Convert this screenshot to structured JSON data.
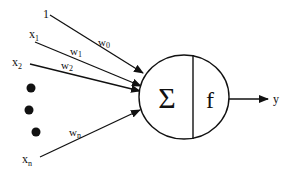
{
  "diagram": {
    "inputs": [
      {
        "label": "1",
        "sub": "",
        "weight": "w",
        "weight_sub": "0"
      },
      {
        "label": "x",
        "sub": "1",
        "weight": "w",
        "weight_sub": "1"
      },
      {
        "label": "x",
        "sub": "2",
        "weight": "w",
        "weight_sub": "2"
      },
      {
        "label": "x",
        "sub": "n",
        "weight": "w",
        "weight_sub": "n"
      }
    ],
    "ellipsis": "•••",
    "summation_symbol": "Σ",
    "activation_symbol": "f",
    "output_label": "y"
  }
}
